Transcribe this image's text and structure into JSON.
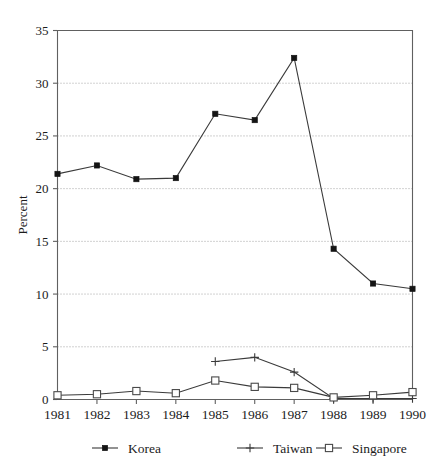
{
  "chart_data": {
    "type": "line",
    "title": "",
    "subtitle": "",
    "xlabel": "",
    "ylabel": "Percent",
    "categories": [
      "1981",
      "1982",
      "1983",
      "1984",
      "1985",
      "1986",
      "1987",
      "1988",
      "1989",
      "1990"
    ],
    "x": [
      1981,
      1982,
      1983,
      1984,
      1985,
      1986,
      1987,
      1988,
      1989,
      1990
    ],
    "xlim": [
      1981,
      1990
    ],
    "ylim": [
      0,
      35
    ],
    "yticks": [
      0,
      5,
      10,
      15,
      20,
      25,
      30,
      35
    ],
    "ytick_labels": [
      "0",
      "5",
      "10",
      "15",
      "20",
      "25",
      "30",
      "35"
    ],
    "grid": "horizontal-dotted",
    "legend_position": "bottom",
    "series": [
      {
        "name": "Korea",
        "marker": "filled-square",
        "values": [
          21.4,
          22.2,
          20.9,
          21.0,
          27.1,
          26.5,
          32.4,
          14.3,
          11.0,
          10.5
        ]
      },
      {
        "name": "Taiwan",
        "marker": "plus",
        "values": [
          null,
          null,
          null,
          null,
          3.6,
          4.0,
          2.6,
          0.1,
          0.1,
          0.1
        ]
      },
      {
        "name": "Singapore",
        "marker": "open-square",
        "values": [
          0.4,
          0.5,
          0.8,
          0.6,
          1.8,
          1.2,
          1.1,
          0.2,
          0.4,
          0.7
        ]
      }
    ]
  },
  "legend": {
    "items": [
      {
        "label": "Korea",
        "marker": "filled-square"
      },
      {
        "label": "Taiwan",
        "marker": "plus"
      },
      {
        "label": "Singapore",
        "marker": "open-square"
      }
    ]
  },
  "axes": {
    "y_title": "Percent",
    "y_tick_labels": [
      "0",
      "5",
      "10",
      "15",
      "20",
      "25",
      "30",
      "35"
    ],
    "x_tick_labels": [
      "1981",
      "1982",
      "1983",
      "1984",
      "1985",
      "1986",
      "1987",
      "1988",
      "1989",
      "1990"
    ]
  },
  "colors": {
    "background": "#ffffff",
    "frame": "#606060",
    "grid": "#9a9a9a",
    "series_line": "#3a3a3a",
    "text": "#1c1c1c"
  }
}
